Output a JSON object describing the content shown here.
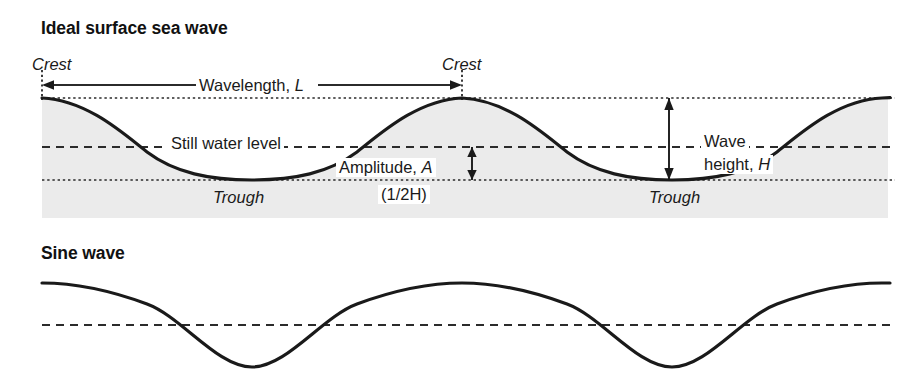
{
  "figure": {
    "panels": [
      {
        "id": "ideal-surface-sea-wave",
        "title": "Ideal surface sea wave",
        "labels": {
          "crest_left": "Crest",
          "crest_right": "Crest",
          "wavelength": "Wavelength, L",
          "still_water_level": "Still water level",
          "amplitude": "Amplitude, A",
          "amplitude_note": "(1/2H)",
          "trough_left": "Trough",
          "trough_right": "Trough",
          "wave_height_line1": "Wave",
          "wave_height_line2": "height, H"
        }
      },
      {
        "id": "sine-wave",
        "title": "Sine wave",
        "labels": {}
      }
    ]
  },
  "chart_data": {
    "type": "line",
    "xlabel": "",
    "ylabel": "",
    "grid": false,
    "legend_position": "none",
    "annotations": [
      {
        "text": "Crest",
        "x": 42,
        "y": 98,
        "style": "italic"
      },
      {
        "text": "Crest",
        "x": 462,
        "y": 98,
        "style": "italic"
      },
      {
        "text": "Wavelength, L",
        "x_from": 42,
        "x_to": 462,
        "y": 85,
        "arrow": "double"
      },
      {
        "text": "Still water level",
        "y": 147,
        "line": "dashed"
      },
      {
        "text": "Amplitude, A",
        "x": 472,
        "y_from": 147,
        "y_to": 180,
        "arrow": "double"
      },
      {
        "text": "(1/2H)",
        "x": 472,
        "y": 190
      },
      {
        "text": "Trough",
        "x": 252,
        "y": 180,
        "style": "italic"
      },
      {
        "text": "Trough",
        "x": 672,
        "y": 180,
        "style": "italic"
      },
      {
        "text": "Wave height, H",
        "x": 669,
        "y_from": 98,
        "y_to": 180,
        "arrow": "double"
      }
    ],
    "reference_lines": [
      {
        "name": "crest-level",
        "y": 98,
        "style": "dotted"
      },
      {
        "name": "still-water-level",
        "y": 147,
        "style": "dashed"
      },
      {
        "name": "trough-level",
        "y": 180,
        "style": "dotted"
      },
      {
        "name": "sine-center-level",
        "y": 325,
        "style": "dashed"
      }
    ],
    "series": [
      {
        "name": "ideal-surface-sea-wave",
        "waveform": "trochoidal",
        "x_start": 42,
        "x_end": 888,
        "wavelength_px": 420,
        "crest_y": 98,
        "trough_y": 180,
        "still_water_y": 147,
        "amplitude_px": 41,
        "wave_height_px": 82,
        "phase": "crest-at-start",
        "crests_x": [
          42,
          462,
          882
        ],
        "troughs_x": [
          252,
          672
        ]
      },
      {
        "name": "sine-wave",
        "waveform": "sinusoid",
        "x_start": 42,
        "x_end": 888,
        "wavelength_px": 420,
        "crest_y": 283,
        "trough_y": 367,
        "center_y": 325,
        "amplitude_px": 42,
        "phase": "crest-at-start",
        "crests_x": [
          42,
          462,
          882
        ],
        "troughs_x": [
          252,
          672
        ]
      }
    ]
  },
  "style": {
    "wave_stroke": "#1a1a1a",
    "water_fill": "#ebebeb",
    "reference_line": "#2b2b2b",
    "background": "#ffffff"
  }
}
